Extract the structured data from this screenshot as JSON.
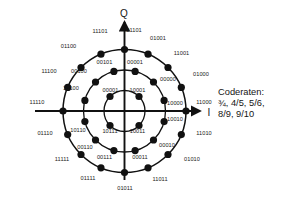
{
  "figure": {
    "type": "constellation-diagram",
    "scheme": "32-APSK",
    "axis_q_label": "Q",
    "axis_i_label": "I",
    "center": {
      "x": 124.5,
      "y": 111.0
    },
    "rings": [
      {
        "name": "inner",
        "radius": 20.5,
        "count": 4,
        "start_angle_deg": 45,
        "step_deg": 90
      },
      {
        "name": "middle",
        "radius": 41.0,
        "count": 12,
        "start_angle_deg": 15,
        "step_deg": 30
      },
      {
        "name": "outer",
        "radius": 61.5,
        "count": 16,
        "start_angle_deg": 0,
        "step_deg": 22.5
      }
    ],
    "point_radius": 3.6,
    "color_ink": "#111111",
    "color_background": "#ffffff"
  },
  "coderates": {
    "title": "Coderaten:",
    "line1": "¾, 4/5, 5/6,",
    "line2": "8/9, 9/10"
  },
  "chart_data": {
    "type": "scatter",
    "title": "",
    "xlabel": "I",
    "ylabel": "Q",
    "xlim": [
      -1.15,
      1.15
    ],
    "ylim": [
      -1.15,
      1.15
    ],
    "grid": false,
    "legend": "none",
    "annotations": [
      "Coderaten:",
      "¾, 4/5, 5/6,",
      "8/9, 9/10"
    ],
    "series": [
      {
        "name": "inner ring",
        "radius": 0.333,
        "points": [
          {
            "label": "10001",
            "angle_deg": 45,
            "x": 0.236,
            "y": 0.236
          },
          {
            "label": "00001",
            "angle_deg": 135,
            "x": -0.236,
            "y": 0.236
          },
          {
            "label": "10011",
            "angle_deg": 315,
            "x": 0.236,
            "y": -0.236
          },
          {
            "label": "10111",
            "angle_deg": 225,
            "x": -0.236,
            "y": -0.236
          }
        ]
      },
      {
        "name": "middle ring",
        "radius": 0.667,
        "points": [
          {
            "label": "10000",
            "angle_deg": 15,
            "x": 0.644,
            "y": 0.173
          },
          {
            "label": "00000",
            "angle_deg": 45,
            "x": 0.471,
            "y": 0.471
          },
          {
            "label": "00001",
            "angle_deg": 75,
            "x": 0.173,
            "y": 0.644
          },
          {
            "label": "00101",
            "angle_deg": 105,
            "x": -0.173,
            "y": 0.644
          },
          {
            "label": "00100",
            "angle_deg": 135,
            "x": -0.471,
            "y": 0.471
          },
          {
            "label": "10100",
            "angle_deg": 165,
            "x": -0.644,
            "y": 0.173
          },
          {
            "label": "10110",
            "angle_deg": 195,
            "x": -0.644,
            "y": -0.173
          },
          {
            "label": "00110",
            "angle_deg": 225,
            "x": -0.471,
            "y": -0.471
          },
          {
            "label": "00111",
            "angle_deg": 255,
            "x": -0.173,
            "y": -0.644
          },
          {
            "label": "00011",
            "angle_deg": 285,
            "x": 0.173,
            "y": -0.644
          },
          {
            "label": "00010",
            "angle_deg": 315,
            "x": 0.471,
            "y": -0.471
          },
          {
            "label": "10010",
            "angle_deg": 345,
            "x": 0.644,
            "y": -0.173
          }
        ]
      },
      {
        "name": "outer ring",
        "radius": 1.0,
        "points": [
          {
            "label": "11000",
            "angle_deg": 0,
            "x": 1.0,
            "y": 0.0
          },
          {
            "label": "01000",
            "angle_deg": 22.5,
            "x": 0.924,
            "y": 0.383
          },
          {
            "label": "11001",
            "angle_deg": 45,
            "x": 0.707,
            "y": 0.707
          },
          {
            "label": "01001",
            "angle_deg": 67.5,
            "x": 0.383,
            "y": 0.924
          },
          {
            "label": "01101",
            "angle_deg": 90,
            "x": 0.0,
            "y": 1.0
          },
          {
            "label": "11101",
            "angle_deg": 112.5,
            "x": -0.383,
            "y": 0.924
          },
          {
            "label": "01100",
            "angle_deg": 135,
            "x": -0.707,
            "y": 0.707
          },
          {
            "label": "11100",
            "angle_deg": 157.5,
            "x": -0.924,
            "y": 0.383
          },
          {
            "label": "11110",
            "angle_deg": 180,
            "x": -1.0,
            "y": 0.0
          },
          {
            "label": "01110",
            "angle_deg": 202.5,
            "x": -0.924,
            "y": -0.383
          },
          {
            "label": "11111",
            "angle_deg": 225,
            "x": -0.707,
            "y": -0.707
          },
          {
            "label": "01111",
            "angle_deg": 247.5,
            "x": -0.383,
            "y": -0.924
          },
          {
            "label": "01011",
            "angle_deg": 270,
            "x": 0.0,
            "y": -1.0
          },
          {
            "label": "11011",
            "angle_deg": 292.5,
            "x": 0.383,
            "y": -0.924
          },
          {
            "label": "01010",
            "angle_deg": 315,
            "x": 0.707,
            "y": -0.707
          },
          {
            "label": "11010",
            "angle_deg": 337.5,
            "x": 0.924,
            "y": -0.383
          }
        ]
      }
    ]
  },
  "labels": {
    "inner": [
      {
        "text": "10001",
        "lx": 137.5,
        "ly": 90.5
      },
      {
        "text": "00001",
        "lx": 110.5,
        "ly": 90.5
      },
      {
        "text": "10011",
        "lx": 137.5,
        "ly": 131.5
      },
      {
        "text": "10111",
        "lx": 110.0,
        "ly": 131.5
      }
    ],
    "middle": [
      {
        "text": "10000",
        "lx": 175.0,
        "ly": 104.0
      },
      {
        "text": "00000",
        "lx": 168.0,
        "ly": 80.0
      },
      {
        "text": "00001",
        "lx": 135.0,
        "ly": 63.0
      },
      {
        "text": "00101",
        "lx": 104.5,
        "ly": 63.0
      },
      {
        "text": "00100",
        "lx": 79.0,
        "ly": 72.0
      },
      {
        "text": "10100",
        "lx": 71.0,
        "ly": 88.5
      },
      {
        "text": "10110",
        "lx": 78.0,
        "ly": 130.5
      },
      {
        "text": "00110",
        "lx": 85.0,
        "ly": 147.5
      },
      {
        "text": "00111",
        "lx": 104.5,
        "ly": 157.5
      },
      {
        "text": "00011",
        "lx": 140.0,
        "ly": 157.5
      },
      {
        "text": "00010",
        "lx": 167.0,
        "ly": 145.5
      },
      {
        "text": "10010",
        "lx": 175.0,
        "ly": 120.0
      }
    ],
    "outer": [
      {
        "text": "11000",
        "lx": 204.0,
        "ly": 103.0
      },
      {
        "text": "01000",
        "lx": 201.0,
        "ly": 75.0
      },
      {
        "text": "11001",
        "lx": 181.5,
        "ly": 53.5
      },
      {
        "text": "01001",
        "lx": 158.0,
        "ly": 39.0
      },
      {
        "text": "01101",
        "lx": 134.0,
        "ly": 31.0
      },
      {
        "text": "11101",
        "lx": 100.0,
        "ly": 32.0
      },
      {
        "text": "01100",
        "lx": 68.5,
        "ly": 47.0
      },
      {
        "text": "11100",
        "lx": 49.0,
        "ly": 72.0
      },
      {
        "text": "11110",
        "lx": 37.0,
        "ly": 102.5
      },
      {
        "text": "01110",
        "lx": 45.0,
        "ly": 134.0
      },
      {
        "text": "11111",
        "lx": 62.0,
        "ly": 160.0
      },
      {
        "text": "01111",
        "lx": 88.0,
        "ly": 179.0
      },
      {
        "text": "01011",
        "lx": 125.0,
        "ly": 189.0
      },
      {
        "text": "11011",
        "lx": 160.0,
        "ly": 180.0
      },
      {
        "text": "01010",
        "lx": 192.0,
        "ly": 159.5
      },
      {
        "text": "11010",
        "lx": 204.0,
        "ly": 134.0
      }
    ],
    "axes": [
      {
        "text": "Q",
        "lx": 124.0,
        "ly": 13.0
      },
      {
        "text": "I",
        "lx": 209.0,
        "ly": 112.0
      }
    ]
  }
}
